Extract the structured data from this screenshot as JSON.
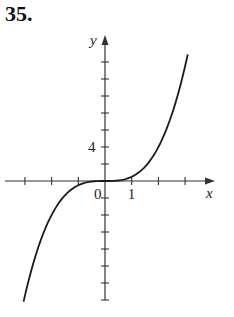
{
  "problem": {
    "number": "35."
  },
  "chart_data": {
    "type": "line",
    "title": "",
    "xlabel": "x",
    "ylabel": "y",
    "x_tick_labels": [
      {
        "value": 0,
        "label": "0"
      },
      {
        "value": 1,
        "label": "1"
      }
    ],
    "y_tick_labels": [
      {
        "value": 4,
        "label": "4"
      }
    ],
    "x_ticks": [
      -3,
      -2,
      -1,
      1,
      2,
      3
    ],
    "y_ticks": [
      -14,
      -12,
      -10,
      -8,
      -6,
      -4,
      -2,
      2,
      4,
      6,
      8,
      10,
      12,
      14
    ],
    "xlim": [
      -3.8,
      4.1
    ],
    "ylim": [
      -14.2,
      17
    ],
    "grid": false,
    "legend": null,
    "series": [
      {
        "name": "curve",
        "x": [
          -3.05,
          -2.5,
          -2,
          -1.5,
          -1,
          -0.5,
          0,
          0.5,
          1,
          1.5,
          2,
          2.5,
          3.1
        ],
        "y": [
          -14.2,
          -7.8,
          -4,
          -1.7,
          -0.5,
          -0.06,
          0,
          0.06,
          0.5,
          1.7,
          4,
          7.8,
          14.9
        ]
      }
    ],
    "colors": {
      "axis": "#333333",
      "curve": "#1a1a1a"
    }
  },
  "layout": {
    "origin_px": [
      105,
      181
    ],
    "px_per_x_unit": 26.7,
    "px_per_y_unit": 8.5,
    "x_axis_px": [
      5,
      215
    ],
    "y_axis_px": [
      300,
      35
    ]
  }
}
